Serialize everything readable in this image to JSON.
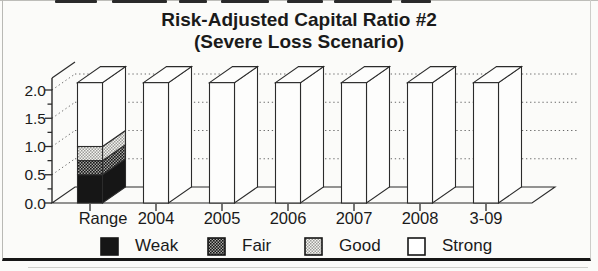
{
  "window": {
    "kind": "scanned report figure",
    "background": "#fbfbf9",
    "ink_color": "#1a1a1a"
  },
  "chart_data": {
    "type": "bar",
    "projection": "3d",
    "stacked": true,
    "title": "Risk-Adjusted Capital Ratio #2",
    "subtitle": "(Severe Loss Scenario)",
    "categories": [
      "Range",
      "2004",
      "2005",
      "2006",
      "2007",
      "2008",
      "3-09"
    ],
    "series": [
      {
        "name": "Weak",
        "values": [
          0.5,
          0,
          0,
          0,
          0,
          0,
          0
        ]
      },
      {
        "name": "Fair",
        "values": [
          0.25,
          0,
          0,
          0,
          0,
          0,
          0
        ]
      },
      {
        "name": "Good",
        "values": [
          0.25,
          0,
          0,
          0,
          0,
          0,
          0
        ]
      },
      {
        "name": "Strong",
        "values": [
          1.13,
          2.13,
          2.13,
          2.13,
          2.13,
          2.13,
          2.13
        ]
      }
    ],
    "ylim": [
      0,
      2.2
    ],
    "yticks": [
      0,
      0.5,
      1,
      1.5,
      2
    ],
    "ytick_labels": [
      "0.0",
      "0.5",
      "1.0",
      "1.5",
      "2.0"
    ],
    "minor_tick_step": 0.25,
    "bars_exceed_axis": true,
    "grid": {
      "style": "dotted",
      "levels": [
        0.5,
        1,
        1.5,
        2
      ],
      "wall": "back"
    },
    "legend": {
      "position": "bottom",
      "entries": [
        {
          "label": "Weak",
          "swatch": "solid-black",
          "color": "#161616"
        },
        {
          "label": "Fair",
          "swatch": "dark-halftone",
          "color": "#6e6e6e"
        },
        {
          "label": "Good",
          "swatch": "light-halftone",
          "color": "#c7c7c7"
        },
        {
          "label": "Strong",
          "swatch": "white-outline",
          "color": "#ffffff"
        }
      ]
    }
  }
}
